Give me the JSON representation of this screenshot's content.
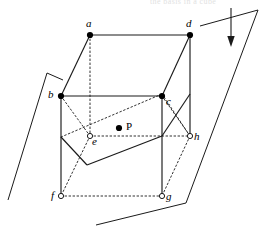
{
  "figure": {
    "type": "geometry-diagram",
    "canvas": {
      "width": 267,
      "height": 234,
      "background": "#ffffff"
    },
    "colors": {
      "stroke": "#1a1a1a",
      "filled_vertex": "#000000",
      "open_vertex_fill": "#ffffff",
      "label": "#000000",
      "faint_text": "#c9c9c9"
    },
    "vertices": [
      {
        "id": "a",
        "label": "a",
        "x": 90,
        "y": 35,
        "marker": "filled",
        "label_dx": -4,
        "label_dy": -16
      },
      {
        "id": "d",
        "label": "d",
        "x": 190,
        "y": 35,
        "marker": "filled",
        "label_dx": -4,
        "label_dy": -16
      },
      {
        "id": "b",
        "label": "b",
        "x": 61,
        "y": 96,
        "marker": "filled",
        "label_dx": -13,
        "label_dy": 1
      },
      {
        "id": "c",
        "label": "c",
        "x": 162,
        "y": 96,
        "marker": "filled",
        "label_dx": 4,
        "label_dy": 8
      },
      {
        "id": "e",
        "label": "e",
        "x": 90,
        "y": 136,
        "marker": "open",
        "label_dx": 3,
        "label_dy": 8
      },
      {
        "id": "h",
        "label": "h",
        "x": 190,
        "y": 136,
        "marker": "open",
        "label_dx": 4,
        "label_dy": 4
      },
      {
        "id": "f",
        "label": "f",
        "x": 61,
        "y": 196,
        "marker": "open",
        "label_dx": -10,
        "label_dy": 2
      },
      {
        "id": "g",
        "label": "g",
        "x": 162,
        "y": 196,
        "marker": "open",
        "label_dx": 4,
        "label_dy": 4
      }
    ],
    "interior_point": {
      "id": "P",
      "label": "P",
      "x": 119,
      "y": 128,
      "marker": "filled",
      "label_dx": 6,
      "label_dy": -3
    },
    "cube_edges_solid": [
      {
        "from": "a",
        "to": "d"
      },
      {
        "from": "a",
        "to": "b"
      },
      {
        "from": "d",
        "to": "c"
      },
      {
        "from": "b",
        "to": "c"
      },
      {
        "from": "b",
        "to": "f"
      },
      {
        "from": "c",
        "to": "g"
      },
      {
        "from": "a",
        "to": "e",
        "style": "hidden"
      },
      {
        "from": "d",
        "to": "h"
      }
    ],
    "cube_edges_hidden": [
      {
        "from": "a",
        "to": "e"
      },
      {
        "from": "e",
        "to": "h"
      },
      {
        "from": "e",
        "to": "f"
      },
      {
        "from": "h",
        "to": "g"
      },
      {
        "from": "f",
        "to": "g"
      },
      {
        "from": "b",
        "to": "e"
      },
      {
        "from": "c",
        "to": "h"
      }
    ],
    "cutting_plane": {
      "name": "section-plane",
      "points": [
        {
          "x": 61,
          "y": 137
        },
        {
          "x": 162,
          "y": 94
        },
        {
          "x": 190,
          "y": 136
        },
        {
          "x": 87,
          "y": 165
        }
      ],
      "solid_segments": [
        {
          "x1": 87,
          "y1": 165,
          "x2": 61,
          "y2": 137
        },
        {
          "x1": 87,
          "y1": 165,
          "x2": 162,
          "y2": 136
        },
        {
          "x1": 162,
          "y1": 136,
          "x2": 190,
          "y2": 94
        }
      ],
      "dotted_segments": [
        {
          "x1": 61,
          "y1": 137,
          "x2": 162,
          "y2": 94
        },
        {
          "x1": 162,
          "y1": 94,
          "x2": 190,
          "y2": 136
        }
      ]
    },
    "outer_plane": {
      "name": "ambient-plane",
      "left_edge": {
        "x1": 47,
        "y1": 73,
        "x2": 8,
        "y2": 200
      },
      "left_tick": {
        "x1": 47,
        "y1": 73,
        "x2": 63,
        "y2": 80
      },
      "right_edge": {
        "x1": 258,
        "y1": 10,
        "x2": 186,
        "y2": 203
      },
      "right_tick": {
        "x1": 258,
        "y1": 10,
        "x2": 200,
        "y2": 26
      },
      "bottom_edge": {
        "x1": 96,
        "y1": 225,
        "x2": 186,
        "y2": 203
      },
      "top_edge": {
        "x1": 200,
        "y1": 26,
        "x2": 258,
        "y2": 10
      }
    },
    "direction_arrow": {
      "name": "downward-arrow",
      "x": 231,
      "y_start": 8,
      "y_end": 44,
      "head_width": 7,
      "head_length": 9
    },
    "cropped_header_text": "the basis in a cube"
  }
}
